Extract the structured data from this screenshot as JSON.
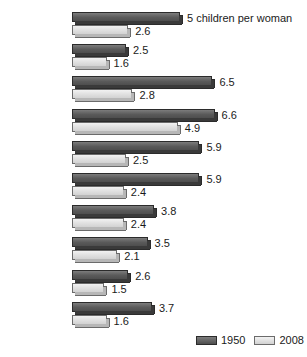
{
  "chart_data": {
    "type": "bar",
    "orientation": "horizontal",
    "title": "",
    "xlabel": "",
    "ylabel": "",
    "unit_note": "5 children per woman",
    "grid": false,
    "legend_position": "bottom-right",
    "xlim": [
      0,
      6.6
    ],
    "categories": [
      "World",
      "Developed\ncountries",
      "Developing\ncountries",
      "Africa",
      "Latin\nAmerica",
      "Asia",
      "Oceania",
      "North\nAmerica",
      "Europe",
      "Canada"
    ],
    "series": [
      {
        "name": "1950",
        "color": "#4e4e4e",
        "values": [
          5,
          2.5,
          6.5,
          6.6,
          5.9,
          5.9,
          3.8,
          3.5,
          2.6,
          3.7
        ],
        "labels": [
          "5 children per woman",
          "2.5",
          "6.5",
          "6.6",
          "5.9",
          "5.9",
          "3.8",
          "3.5",
          "2.6",
          "3.7"
        ]
      },
      {
        "name": "2008",
        "color": "#d2d2d2",
        "values": [
          2.6,
          1.6,
          2.8,
          4.9,
          2.5,
          2.4,
          2.4,
          2.1,
          1.5,
          1.6
        ],
        "labels": [
          "2.6",
          "1.6",
          "2.8",
          "4.9",
          "2.5",
          "2.4",
          "2.4",
          "2.1",
          "1.5",
          "1.6"
        ]
      }
    ]
  },
  "legend": {
    "items": [
      {
        "label": "1950",
        "swatch": "dark-swatch"
      },
      {
        "label": "2008",
        "swatch": "light-swatch"
      }
    ]
  }
}
